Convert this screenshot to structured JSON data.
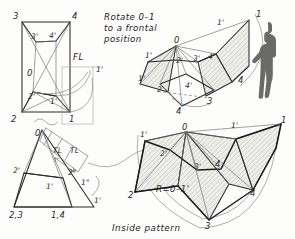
{
  "drawing": {
    "title": "Truncated pyramid development - rotate 0-1 to a frontal position",
    "instruction_lines": [
      "Rotate  0–1",
      "to  a  frontal",
      "position"
    ],
    "caption": "Inside  pattern",
    "radius_note": "R=0–1'",
    "true_length_marks": [
      "TL",
      "TL"
    ],
    "fold_line": "FL"
  },
  "views": {
    "top_view": {
      "name": "Top view - rotation of element 0-1",
      "labels": [
        {
          "text": "3",
          "x": 14,
          "y": 16
        },
        {
          "text": "4",
          "x": 73,
          "y": 16
        },
        {
          "text": "3'",
          "x": 32,
          "y": 36
        },
        {
          "text": "4'",
          "x": 50,
          "y": 35
        },
        {
          "text": "0",
          "x": 28,
          "y": 74
        },
        {
          "text": "2'",
          "x": 31,
          "y": 97
        },
        {
          "text": "1'",
          "x": 51,
          "y": 101
        },
        {
          "text": "2",
          "x": 13,
          "y": 118
        },
        {
          "text": "1",
          "x": 70,
          "y": 117
        },
        {
          "text": "FL",
          "x": 76,
          "y": 62
        },
        {
          "text": "1'",
          "x": 98,
          "y": 70
        }
      ]
    },
    "front_view": {
      "name": "Front view - true length construction",
      "labels": [
        {
          "text": "0",
          "x": 39,
          "y": 136
        },
        {
          "text": "TL",
          "x": 59,
          "y": 150
        },
        {
          "text": "TL",
          "x": 76,
          "y": 150
        },
        {
          "text": "2'",
          "x": 19,
          "y": 169
        },
        {
          "text": "2\"",
          "x": 73,
          "y": 171
        },
        {
          "text": "1'",
          "x": 50,
          "y": 185
        },
        {
          "text": "1\"",
          "x": 85,
          "y": 182
        },
        {
          "text": "1'",
          "x": 96,
          "y": 200
        },
        {
          "text": "2,3",
          "x": 13,
          "y": 213
        },
        {
          "text": "1,4",
          "x": 55,
          "y": 213
        }
      ]
    },
    "pictorial": {
      "name": "Pictorial of truncated pyramid opening up",
      "labels": [
        {
          "text": "0",
          "x": 177,
          "y": 40
        },
        {
          "text": "1'",
          "x": 220,
          "y": 22
        },
        {
          "text": "1",
          "x": 258,
          "y": 14
        },
        {
          "text": "1'",
          "x": 149,
          "y": 57
        },
        {
          "text": "2'",
          "x": 180,
          "y": 60
        },
        {
          "text": "3'",
          "x": 196,
          "y": 58
        },
        {
          "text": "4'",
          "x": 211,
          "y": 57
        },
        {
          "text": "1'",
          "x": 142,
          "y": 78
        },
        {
          "text": "2",
          "x": 160,
          "y": 89
        },
        {
          "text": "4'",
          "x": 188,
          "y": 85
        },
        {
          "text": "4",
          "x": 240,
          "y": 80
        },
        {
          "text": "3",
          "x": 209,
          "y": 101
        },
        {
          "text": "4",
          "x": 178,
          "y": 110
        }
      ]
    },
    "pattern": {
      "name": "Inside pattern development",
      "labels": [
        {
          "text": "0",
          "x": 185,
          "y": 131
        },
        {
          "text": "1'",
          "x": 234,
          "y": 129
        },
        {
          "text": "1",
          "x": 282,
          "y": 121
        },
        {
          "text": "1'",
          "x": 143,
          "y": 140
        },
        {
          "text": "2'",
          "x": 163,
          "y": 153
        },
        {
          "text": "3'",
          "x": 198,
          "y": 166
        },
        {
          "text": "4",
          "x": 216,
          "y": 164
        },
        {
          "text": "2",
          "x": 131,
          "y": 195
        },
        {
          "text": "4",
          "x": 252,
          "y": 193
        },
        {
          "text": "3",
          "x": 208,
          "y": 224
        }
      ]
    }
  },
  "scale_figure": {
    "name": "human-figure-for-scale"
  },
  "colors": {
    "ink": "#2a2a2a",
    "light_ink": "#8b8b8b",
    "paper": "#fdfdfb",
    "hatch_fill": "#e9e9e6",
    "figure": "#6a6a68"
  }
}
